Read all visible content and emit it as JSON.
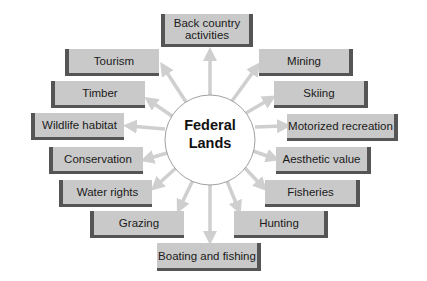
{
  "diagram": {
    "center": {
      "label_line1": "Federal",
      "label_line2": "Lands"
    },
    "nodes": [
      {
        "id": "back-country",
        "label_line1": "Back country",
        "label_line2": "activities"
      },
      {
        "id": "tourism",
        "label": "Tourism"
      },
      {
        "id": "timber",
        "label": "Timber"
      },
      {
        "id": "wildlife-habitat",
        "label": "Wildlife habitat"
      },
      {
        "id": "conservation",
        "label": "Conservation"
      },
      {
        "id": "water-rights",
        "label": "Water rights"
      },
      {
        "id": "grazing",
        "label": "Grazing"
      },
      {
        "id": "boating-fishing",
        "label": "Boating and fishing"
      },
      {
        "id": "mining",
        "label": "Mining"
      },
      {
        "id": "skiing",
        "label": "Skiing"
      },
      {
        "id": "motorized-recreation",
        "label": "Motorized recreation"
      },
      {
        "id": "aesthetic-value",
        "label": "Aesthetic value"
      },
      {
        "id": "fisheries",
        "label": "Fisheries"
      },
      {
        "id": "hunting",
        "label": "Hunting"
      }
    ],
    "colors": {
      "box_fill": "#c9c9c9",
      "box_shadow": "#555555",
      "arrow": "#cfcfcf",
      "circle_stroke": "#888888"
    }
  }
}
